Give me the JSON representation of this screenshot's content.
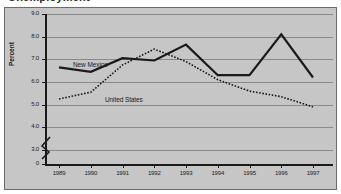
{
  "figure": {
    "clipped_title": "Unemployment",
    "background_color": "#c6c6c6",
    "frame_color": "#6b6b6b",
    "axis_color": "#1a1a1a",
    "gridline_color": "#8a8a8a"
  },
  "axis": {
    "y_label": "Percent",
    "y_ticks": [
      "9.0",
      "8.0",
      "7.0",
      "6.0",
      "5.0",
      "4.0",
      "3.0",
      "0"
    ],
    "y_break_note": "0",
    "x_ticks": [
      "1989",
      "1990",
      "1991",
      "1992",
      "1993",
      "1994",
      "1995",
      "1996",
      "1997"
    ]
  },
  "annotations": {
    "new_mexico_label": "New Mexico",
    "united_states_label": "United States"
  },
  "chart_data": {
    "type": "line",
    "title": "Unemployment",
    "xlabel": "",
    "ylabel": "Percent",
    "x": [
      1989,
      1990,
      1991,
      1992,
      1993,
      1994,
      1995,
      1996,
      1997
    ],
    "categories": [
      "1989",
      "1990",
      "1991",
      "1992",
      "1993",
      "1994",
      "1995",
      "1996",
      "1997"
    ],
    "ylim": [
      3.0,
      9.0
    ],
    "y_axis_break": true,
    "y_break_below": 3.0,
    "y_tick_step": 1.0,
    "grid": true,
    "legend": "inline-annotations",
    "series": [
      {
        "name": "New Mexico",
        "style": "solid",
        "color": "#1a1a1a",
        "line_width": 2.2,
        "values": [
          6.65,
          6.45,
          7.05,
          6.95,
          7.65,
          6.3,
          6.3,
          8.1,
          6.2
        ]
      },
      {
        "name": "United States",
        "style": "dotted",
        "color": "#1a1a1a",
        "line_width": 1.6,
        "values": [
          5.25,
          5.55,
          6.75,
          7.45,
          6.9,
          6.1,
          5.6,
          5.35,
          4.9
        ]
      }
    ]
  }
}
